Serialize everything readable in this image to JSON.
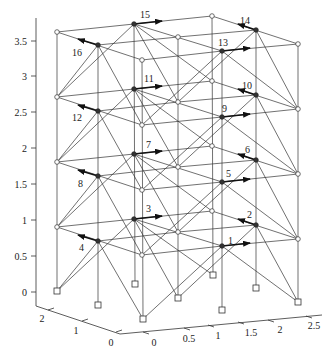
{
  "figure": {
    "type": "3D space frame (4-storey steel frame) with numbered loaded nodes",
    "z_axis": {
      "ticks": [
        "0",
        "0.5",
        "1",
        "1.5",
        "2",
        "2.5",
        "3",
        "3.5"
      ]
    },
    "y_axis": {
      "ticks": [
        "0",
        "1",
        "2"
      ]
    },
    "x_axis": {
      "ticks": [
        "0",
        "0.5",
        "1",
        "1.5",
        "2",
        "2.5"
      ]
    },
    "node_labels": [
      "1",
      "2",
      "3",
      "4",
      "5",
      "6",
      "7",
      "8",
      "9",
      "10",
      "11",
      "12",
      "13",
      "14",
      "15",
      "16"
    ],
    "colors": {
      "line": "#333333",
      "background": "#ffffff",
      "load_arrow": "#111111"
    }
  }
}
